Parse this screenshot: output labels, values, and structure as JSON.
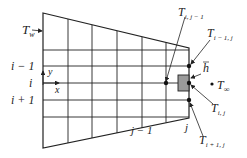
{
  "diagram": {
    "colors": {
      "lines": "#222222",
      "cell_fill": "#9a9a9a",
      "background": "#ffffff"
    },
    "grid": {
      "left_x": 43,
      "right_x": 189,
      "top_left_y": 13,
      "bottom_left_y": 148,
      "top_right_y": 48,
      "bottom_right_y": 118,
      "vertical_lines_x": [
        68,
        92,
        117,
        142,
        166
      ],
      "horizontal_lines_y": [
        50,
        66,
        83,
        100,
        117
      ]
    },
    "labels": {
      "wall_temp": "T",
      "wall_temp_sub": "w",
      "row_im1": "i − 1",
      "row_i": "i",
      "row_ip1": "i + 1",
      "axis_y": "y",
      "axis_x": "x",
      "col_jm1": "j − 1",
      "col_j": "j",
      "node_i_jm1": "T",
      "node_i_jm1_sub": "i, j − 1",
      "node_im1_j": "T",
      "node_im1_j_sub": "i − 1, j",
      "h_bar": "h",
      "node_i_j": "T",
      "node_i_j_sub": "i, j",
      "node_ip1_j": "T",
      "node_ip1_j_sub": "i + 1, j",
      "ambient": "T",
      "ambient_sub": "∞"
    }
  }
}
